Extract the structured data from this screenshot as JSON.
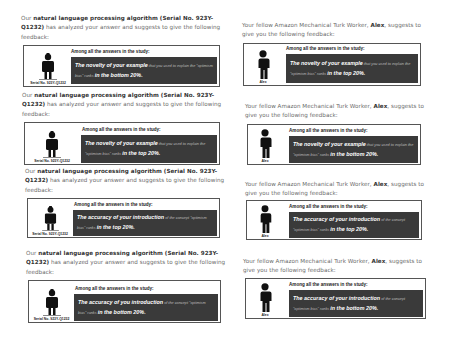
{
  "common": {
    "ai_intro_pre": "Our ",
    "ai_name": "natural language processing algorithm",
    "ai_serial_paren": "(Serial No. 923Y-Q1232)",
    "ai_intro_post": " has analyzed your answer and suggests to give the following feedback:",
    "human_intro_pre": "Your fellow Amazon Mechanical Turk Worker, ",
    "human_name": "Alex",
    "human_intro_post": ", suggests to give you the following feedback:",
    "headline": "Among all the answers in the study:",
    "ai_caption": "Serial No. 923Y-Q1232",
    "human_caption": "Alex",
    "robot_icon": "robot-icon",
    "person_icon": "person-icon"
  },
  "left_panels": [
    {
      "feedback_em": "The novelty of your example",
      "feedback_small": " that you used to explain the \"optimism bias\" ranks ",
      "rank": "in the bottom 20%."
    },
    {
      "feedback_em": "The novelty of your example",
      "feedback_small": " that you used to explain the \"optimism bias\" ranks ",
      "rank": "in the top 20%."
    },
    {
      "feedback_em": "The accuracy of your introduction",
      "feedback_small": " of the concept \"optimism bias\" ranks ",
      "rank": "in the top 20%."
    },
    {
      "feedback_em": "The accuracy of you introduction",
      "feedback_small": " of the concept \"optimism bias\" ranks ",
      "rank": "in the bottom 20%."
    }
  ],
  "right_panels": [
    {
      "feedback_em": "The novelty of your example",
      "feedback_small": " that you used to explain the \"optimism bias\" ranks ",
      "rank": "in the top 20%."
    },
    {
      "feedback_em": "The novelty of your example",
      "feedback_small": " that you used to explain the \"optimism bias\" ranks ",
      "rank": "in the bottom 20%."
    },
    {
      "feedback_em": "The accuracy of your introduction",
      "feedback_small": " of the concept \"optimism bias\" ranks ",
      "rank": "in the top 20%."
    },
    {
      "feedback_em": "The accuracy of your introduction",
      "feedback_small": " of the concept \"optimism bias\" ranks ",
      "rank": "in the bottom 20%."
    }
  ],
  "colors": {
    "dark_box": "#3a3a3a",
    "border": "#555555",
    "intro_text": "#6a6a6a"
  }
}
